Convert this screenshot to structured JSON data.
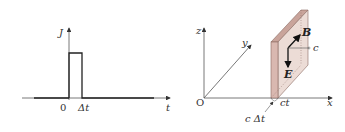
{
  "left_plot": {
    "y_axis_label": "J",
    "x_axis_label": "t",
    "origin_label": "0",
    "pulse_width_label": "Δt",
    "description": "Rectangular current pulse J(t) from t=0 to t=Δt"
  },
  "right_diagram": {
    "axes": {
      "x": "x",
      "y": "y",
      "z": "z",
      "origin": "O"
    },
    "vectors": {
      "magnetic": "B",
      "electric": "E"
    },
    "speed_label": "c",
    "front_position_label": "ct",
    "thickness_label": "c Δt",
    "slab_color": "#d9b8b0",
    "slab_edge_color": "#8a6a62"
  }
}
